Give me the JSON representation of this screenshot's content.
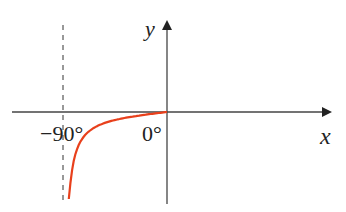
{
  "chart_data": {
    "type": "line",
    "title": "",
    "xlabel": "x",
    "ylabel": "y",
    "tick_labels": [
      "−90°",
      "0°"
    ],
    "asymptote": {
      "x": -90,
      "style": "dashed"
    },
    "series": [
      {
        "name": "curve",
        "color": "#e8401c",
        "domain": [
          -85,
          0
        ],
        "description": "curve decreasing toward asymptote at -90°, meeting origin at 0°"
      }
    ],
    "xlim": [
      -120,
      110
    ],
    "grid": false
  }
}
